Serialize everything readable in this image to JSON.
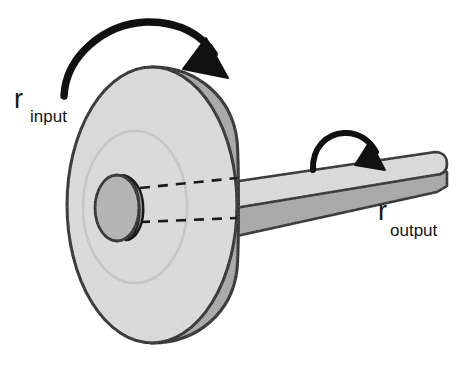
{
  "figure": {
    "type": "mechanical-diagram",
    "background_color": "#ffffff"
  },
  "labels": {
    "input": {
      "base": "r",
      "subscript": "input"
    },
    "output": {
      "base": "r",
      "subscript": "output"
    }
  },
  "parts": {
    "wheel": {
      "name": "large-disc",
      "face_color": "#d8d8d8",
      "rim_color": "#a8a8a8",
      "outline_color": "#1a1a1a"
    },
    "hub": {
      "name": "center-hub",
      "face_color": "#b4b4b4",
      "side_color": "#9a9a9a",
      "outline_color": "#1a1a1a"
    },
    "shaft": {
      "name": "output-shaft",
      "top_color": "#d8d8d8",
      "side_color": "#a8a8a8",
      "outline_color": "#1a1a1a"
    },
    "axis_lines": {
      "name": "dashed-axis",
      "color": "#1a1a1a",
      "style": "dashed"
    }
  },
  "arrows": {
    "input_rotation": {
      "name": "input-rotation-arrow",
      "color": "#111111",
      "direction": "clockwise"
    },
    "output_rotation": {
      "name": "output-rotation-arrow",
      "color": "#111111",
      "direction": "clockwise"
    }
  }
}
